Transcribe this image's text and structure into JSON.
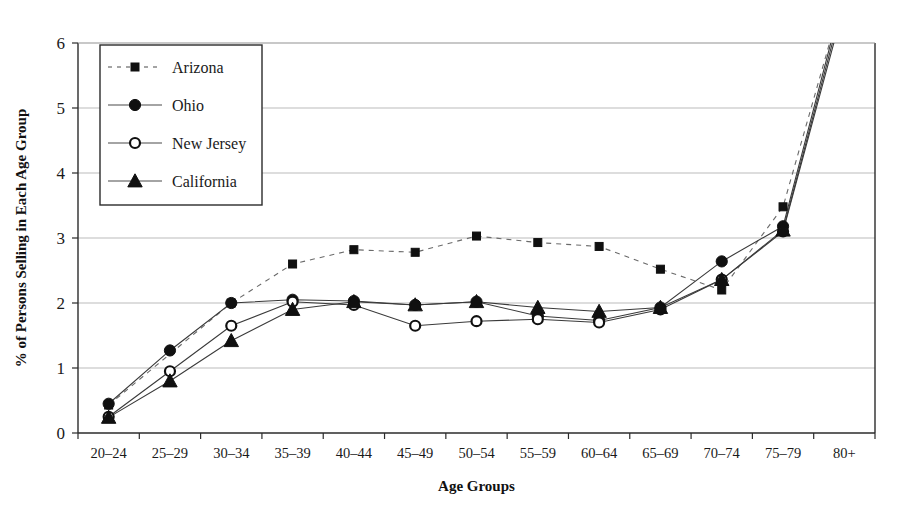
{
  "chart_data": {
    "type": "line",
    "title": "",
    "xlabel": "Age Groups",
    "ylabel": "% of Persons Selling in Each Age Group",
    "categories": [
      "20–24",
      "25–29",
      "30–34",
      "35–39",
      "40–44",
      "45–49",
      "50–54",
      "55–59",
      "60–64",
      "65–69",
      "70–74",
      "75–79",
      "80+"
    ],
    "ylim": [
      0,
      6
    ],
    "yticks": [
      0,
      1,
      2,
      3,
      4,
      5,
      6
    ],
    "ytick_labels": [
      "0",
      "1",
      "2",
      "3",
      "4",
      "5",
      "6"
    ],
    "grid": "horizontal",
    "legend_position": "top-left-inside",
    "note_clipped": "All four series rise steeply after 75–79 and exit above the top of the 0–6 axis at 80+.",
    "series": [
      {
        "name": "Arizona",
        "marker": "filled-square",
        "line_style": "dashed",
        "color": "#101010",
        "values": [
          0.43,
          null,
          2.0,
          2.6,
          2.82,
          2.78,
          3.03,
          2.93,
          2.87,
          2.52,
          2.2,
          3.48,
          6.8
        ]
      },
      {
        "name": "Ohio",
        "marker": "filled-circle",
        "line_style": "solid",
        "color": "#101010",
        "values": [
          0.45,
          1.27,
          2.0,
          2.05,
          2.03,
          1.97,
          2.02,
          1.8,
          1.73,
          1.93,
          2.64,
          3.18,
          6.8
        ]
      },
      {
        "name": "New Jersey",
        "marker": "open-circle",
        "line_style": "solid",
        "color": "#101010",
        "values": [
          0.25,
          0.95,
          1.65,
          2.02,
          1.97,
          1.65,
          1.72,
          1.75,
          1.7,
          1.9,
          2.36,
          3.1,
          6.6
        ]
      },
      {
        "name": "California",
        "marker": "filled-triangle",
        "line_style": "solid",
        "color": "#101010",
        "values": [
          0.24,
          0.8,
          1.42,
          1.9,
          2.02,
          1.97,
          2.02,
          1.93,
          1.87,
          1.93,
          2.36,
          3.12,
          6.7
        ]
      }
    ]
  },
  "legend": {
    "entries": [
      {
        "label": "Arizona"
      },
      {
        "label": "Ohio"
      },
      {
        "label": "New Jersey"
      },
      {
        "label": "California"
      }
    ]
  }
}
